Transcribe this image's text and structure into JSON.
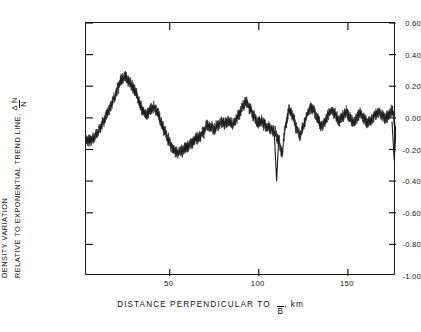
{
  "axes": {
    "y_title_line1": "DENSITY VARIATION",
    "y_title_line2": "RELATIVE TO EXPONENTIAL TREND LINE,",
    "y_symbol_numerator": "Δ N",
    "y_symbol_denominator": "N",
    "x_title_prefix": "DISTANCE  PERPENDICULAR  TO",
    "x_title_symbol": "B",
    "x_title_suffix": ", km",
    "y_ticks": [
      "0.60",
      "0.40",
      "0.20",
      "0.00",
      "-0.20",
      "-0.40",
      "-0.60",
      "-0.80",
      "-1.00"
    ],
    "x_ticks": [
      "50",
      "100",
      "150"
    ]
  },
  "chart_data": {
    "type": "line",
    "title": "",
    "xlabel": "DISTANCE PERPENDICULAR TO B̄, km",
    "ylabel": "DENSITY VARIATION RELATIVE TO EXPONENTIAL TREND LINE, ΔN/N",
    "xlim": [
      3,
      177
    ],
    "ylim": [
      -1.0,
      0.6
    ],
    "xticks": [
      50,
      100,
      150
    ],
    "yticks": [
      0.6,
      0.4,
      0.2,
      0.0,
      -0.2,
      -0.4,
      -0.6,
      -0.8,
      -1.0
    ],
    "grid": false,
    "legend": null,
    "series": [
      {
        "name": "density variation",
        "description": "Dense high-frequency noise band about a slowly varying envelope; rises from -0.14 to a peak near 0.27 at 22 km, falls to about -0.22 near 50 km, recovers toward 0.00 with a local high near 0.13 at 90 km, a sharp negative spike to -0.40 at 110 km, then oscillates about 0.00 to 0.05 before a final drop to -0.27 at the right edge.",
        "x": [
          3,
          5,
          7,
          9,
          11,
          13,
          15,
          17,
          19,
          21,
          23,
          25,
          27,
          29,
          31,
          33,
          35,
          37,
          39,
          41,
          43,
          45,
          47,
          49,
          51,
          53,
          55,
          57,
          59,
          61,
          63,
          65,
          67,
          69,
          71,
          73,
          75,
          77,
          79,
          81,
          83,
          85,
          87,
          89,
          91,
          93,
          95,
          97,
          99,
          101,
          103,
          105,
          107,
          109,
          111,
          113,
          115,
          117,
          119,
          121,
          123,
          125,
          127,
          129,
          131,
          133,
          135,
          137,
          139,
          141,
          143,
          145,
          147,
          149,
          151,
          153,
          155,
          157,
          159,
          161,
          163,
          165,
          167,
          169,
          171,
          173,
          175,
          177
        ],
        "y": [
          -0.14,
          -0.14,
          -0.13,
          -0.1,
          -0.06,
          -0.02,
          0.03,
          0.08,
          0.13,
          0.19,
          0.24,
          0.26,
          0.23,
          0.2,
          0.16,
          0.1,
          0.04,
          0.02,
          0.05,
          0.07,
          0.04,
          -0.02,
          -0.08,
          -0.13,
          -0.18,
          -0.21,
          -0.22,
          -0.21,
          -0.19,
          -0.17,
          -0.15,
          -0.13,
          -0.12,
          -0.09,
          -0.04,
          -0.06,
          -0.07,
          -0.05,
          -0.03,
          -0.04,
          -0.02,
          -0.04,
          -0.02,
          0.02,
          0.07,
          0.1,
          0.06,
          0.01,
          -0.03,
          -0.02,
          -0.04,
          -0.06,
          -0.07,
          -0.09,
          -0.14,
          -0.22,
          -0.05,
          0.05,
          0.02,
          -0.06,
          -0.11,
          -0.05,
          0.02,
          0.06,
          0.04,
          -0.01,
          -0.05,
          -0.03,
          0.02,
          0.05,
          0.02,
          -0.02,
          0.01,
          0.04,
          0.0,
          -0.03,
          0.0,
          0.03,
          0.0,
          -0.03,
          -0.02,
          0.01,
          0.04,
          0.02,
          -0.01,
          0.02,
          0.05,
          -0.1
        ],
        "band_halfwidth": 0.035,
        "spikes": [
          {
            "x": 110,
            "y": -0.4,
            "label": "deep negative spike"
          },
          {
            "x": 176,
            "y": -0.27,
            "label": "terminal drop"
          }
        ]
      }
    ]
  },
  "style": {
    "ink": "#1a1a1a",
    "background": "#ffffff"
  }
}
